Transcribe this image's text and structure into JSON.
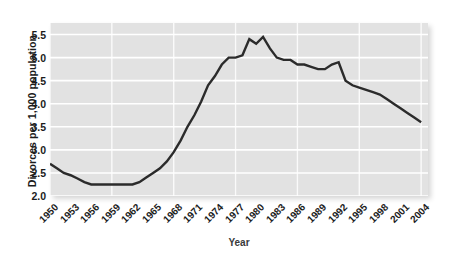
{
  "chart_data": {
    "type": "line",
    "title": "",
    "xlabel": "Year",
    "ylabel": "Divorces per 1,000 population",
    "xlim": [
      1950,
      2005
    ],
    "ylim": [
      2.0,
      5.75
    ],
    "grid": true,
    "legend": "none",
    "y_ticks": [
      "2.0",
      "2.5",
      "3.0",
      "3.5",
      "4.0",
      "4.5",
      "5.0",
      "5.5"
    ],
    "y_tick_values": [
      2.0,
      2.5,
      3.0,
      3.5,
      4.0,
      4.5,
      5.0,
      5.5
    ],
    "x_ticks": [
      "1950",
      "1953",
      "1956",
      "1959",
      "1962",
      "1965",
      "1968",
      "1971",
      "1974",
      "1977",
      "1980",
      "1983",
      "1986",
      "1989",
      "1992",
      "1995",
      "1998",
      "2001",
      "2004"
    ],
    "x_tick_values": [
      1950,
      1953,
      1956,
      1959,
      1962,
      1965,
      1968,
      1971,
      1974,
      1977,
      1980,
      1983,
      1986,
      1989,
      1992,
      1995,
      1998,
      2001,
      2004
    ],
    "series": [
      {
        "name": "Divorce rate",
        "color": "#2b2b2b",
        "x": [
          1950,
          1951,
          1952,
          1953,
          1954,
          1955,
          1956,
          1957,
          1958,
          1959,
          1960,
          1961,
          1962,
          1963,
          1964,
          1965,
          1966,
          1967,
          1968,
          1969,
          1970,
          1971,
          1972,
          1973,
          1974,
          1975,
          1976,
          1977,
          1978,
          1979,
          1980,
          1981,
          1982,
          1983,
          1984,
          1985,
          1986,
          1987,
          1988,
          1989,
          1990,
          1991,
          1992,
          1993,
          1994,
          1995,
          1996,
          1997,
          1998,
          1999,
          2000,
          2001,
          2002,
          2003,
          2004
        ],
        "values": [
          2.7,
          2.6,
          2.5,
          2.45,
          2.38,
          2.3,
          2.25,
          2.25,
          2.25,
          2.25,
          2.25,
          2.25,
          2.25,
          2.3,
          2.4,
          2.5,
          2.6,
          2.75,
          2.95,
          3.2,
          3.5,
          3.75,
          4.05,
          4.4,
          4.6,
          4.85,
          5.0,
          5.0,
          5.05,
          5.4,
          5.3,
          5.45,
          5.2,
          5.0,
          4.95,
          4.95,
          4.85,
          4.85,
          4.8,
          4.75,
          4.75,
          4.85,
          4.9,
          4.5,
          4.4,
          4.35,
          4.3,
          4.25,
          4.2,
          4.1,
          4.0,
          3.9,
          3.8,
          3.7,
          3.6
        ]
      }
    ],
    "annotations": [
      {
        "label": "peak",
        "x": 1981,
        "y": 5.45
      },
      {
        "label": "trough",
        "x": 1958,
        "y": 2.25
      },
      {
        "label": "secondary-peak",
        "x": 1992,
        "y": 4.9
      }
    ],
    "colors": {
      "line": "#2b2b2b",
      "panel_background": "#e2e2e2",
      "gridline": "#ffffff",
      "text": "#1c1c1c",
      "figure_background": "#ffffff"
    }
  }
}
